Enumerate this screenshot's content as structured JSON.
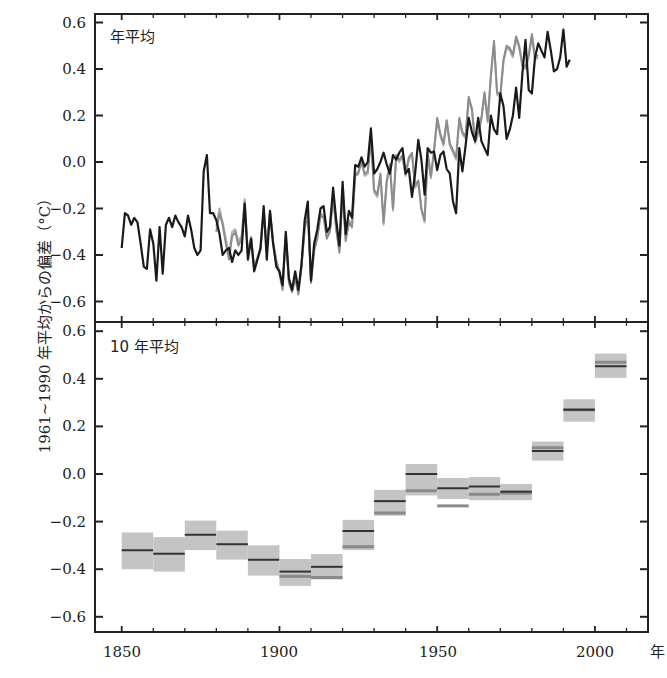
{
  "chart_data": [
    {
      "type": "line",
      "panel": "top",
      "title": "年平均",
      "xlabel": "年",
      "ylabel": "1961~1990 年平均からの偏差（°C）",
      "xlim": [
        1841.5,
        2018.5
      ],
      "ylim": [
        -0.65,
        0.64
      ],
      "x_ticks": [
        1850,
        1900,
        1950,
        2000
      ],
      "y_ticks": [
        -0.6,
        -0.4,
        -0.2,
        0.0,
        0.2,
        0.4,
        0.6
      ],
      "y_tick_labels": [
        "−0.6",
        "−0.4",
        "−0.2",
        "0.0",
        "0.2",
        "0.4",
        "0.6"
      ],
      "grid": false,
      "legend": null,
      "series": [
        {
          "name": "dataset-1 (black)",
          "color": "#1a1a1a",
          "start_year": 1850,
          "values": [
            -0.37,
            -0.22,
            -0.23,
            -0.27,
            -0.24,
            -0.26,
            -0.35,
            -0.45,
            -0.46,
            -0.29,
            -0.35,
            -0.51,
            -0.28,
            -0.48,
            -0.27,
            -0.24,
            -0.28,
            -0.23,
            -0.26,
            -0.28,
            -0.32,
            -0.23,
            -0.29,
            -0.37,
            -0.4,
            -0.38,
            -0.04,
            0.03,
            -0.22,
            -0.22,
            -0.25,
            -0.31,
            -0.4,
            -0.38,
            -0.37,
            -0.43,
            -0.38,
            -0.4,
            -0.38,
            -0.18,
            -0.42,
            -0.33,
            -0.47,
            -0.42,
            -0.37,
            -0.19,
            -0.42,
            -0.21,
            -0.35,
            -0.45,
            -0.47,
            -0.53,
            -0.3,
            -0.5,
            -0.55,
            -0.47,
            -0.55,
            -0.44,
            -0.25,
            -0.17,
            -0.51,
            -0.35,
            -0.29,
            -0.2,
            -0.19,
            -0.3,
            -0.28,
            -0.11,
            -0.25,
            -0.36,
            -0.085,
            -0.31,
            -0.21,
            -0.24,
            -0.013,
            -0.02,
            0.02,
            -0.02,
            0.0,
            0.145,
            -0.05,
            -0.03,
            0.0,
            0.04,
            -0.01,
            -0.05,
            0.03,
            0.01,
            0.04,
            0.06,
            -0.05,
            -0.03,
            -0.15,
            -0.05,
            0.095,
            0.01,
            -0.14,
            0.06,
            0.04,
            0.045,
            -0.035,
            0.03,
            0.045,
            -0.03,
            -0.05,
            -0.17,
            -0.22,
            0.06,
            -0.04,
            0.07,
            0.19,
            0.13,
            0.09,
            0.19,
            0.09,
            0.06,
            0.03,
            0.2,
            0.14,
            0.12,
            0.295,
            0.24,
            0.1,
            0.14,
            0.2,
            0.32,
            0.19,
            0.38,
            0.525,
            0.31,
            0.295,
            0.45,
            0.51,
            0.48,
            0.45,
            0.56,
            0.48,
            0.39,
            0.4,
            0.45,
            0.57,
            0.41,
            0.44
          ],
          "end_year": 2012
        },
        {
          "name": "dataset-2 (gray)",
          "color": "#8c8c8c",
          "start_year": 1880,
          "values": [
            -0.3,
            -0.22,
            -0.27,
            -0.35,
            -0.42,
            -0.32,
            -0.3,
            -0.36,
            -0.33,
            -0.17,
            -0.4,
            -0.33,
            -0.46,
            -0.42,
            -0.38,
            -0.21,
            -0.38,
            -0.22,
            -0.35,
            -0.43,
            -0.48,
            -0.55,
            -0.32,
            -0.52,
            -0.56,
            -0.5,
            -0.57,
            -0.45,
            -0.29,
            -0.22,
            -0.52,
            -0.38,
            -0.33,
            -0.23,
            -0.24,
            -0.33,
            -0.3,
            -0.15,
            -0.29,
            -0.39,
            -0.13,
            -0.34,
            -0.26,
            -0.28,
            -0.06,
            -0.05,
            0.0,
            -0.05,
            -0.04,
            0.11,
            -0.12,
            -0.14,
            -0.05,
            -0.26,
            -0.08,
            -0.01,
            -0.2,
            0.03,
            0.01,
            0.03,
            -0.05,
            0.02,
            0.04,
            -0.1,
            -0.08,
            -0.2,
            -0.25,
            0.04,
            -0.06,
            0.05,
            0.19,
            0.12,
            0.08,
            0.18,
            0.08,
            0.05,
            0.02,
            0.19,
            0.13,
            0.11,
            0.28,
            0.23,
            0.09,
            0.13,
            0.19,
            0.3,
            0.18,
            0.37,
            0.52,
            0.3,
            0.29,
            0.44,
            0.5,
            0.49,
            0.46,
            0.54,
            0.5,
            0.42,
            0.41,
            0.46,
            0.55,
            0.45,
            0.46
          ],
          "end_year": 2012
        },
        {
          "name": "dataset-3 (light gray)",
          "color": "#b0b0b0",
          "start_year": 1880,
          "values": [
            -0.28,
            -0.2,
            -0.26,
            -0.33,
            -0.4,
            -0.3,
            -0.29,
            -0.34,
            -0.32,
            -0.16,
            -0.39,
            -0.32,
            -0.45,
            -0.41,
            -0.37,
            -0.2,
            -0.37,
            -0.21,
            -0.34,
            -0.42,
            -0.47,
            -0.54,
            -0.31,
            -0.51,
            -0.55,
            -0.49,
            -0.56,
            -0.44,
            -0.28,
            -0.21,
            -0.5,
            -0.37,
            -0.32,
            -0.22,
            -0.23,
            -0.32,
            -0.29,
            -0.14,
            -0.28,
            -0.38,
            -0.12,
            -0.33,
            -0.25,
            -0.27,
            -0.05,
            -0.04,
            0.01,
            -0.06,
            -0.05,
            0.1,
            -0.13,
            -0.15,
            -0.06,
            -0.27,
            -0.09,
            -0.02,
            -0.21,
            0.02,
            0.0,
            0.02,
            -0.06,
            0.01,
            0.03,
            -0.11,
            -0.09,
            -0.21,
            -0.26,
            0.03,
            -0.07,
            0.04,
            0.18,
            0.11,
            0.07,
            0.17,
            0.07,
            0.04,
            0.01,
            0.18,
            0.12,
            0.1,
            0.27,
            0.22,
            0.08,
            0.12,
            0.18,
            0.29,
            0.17,
            0.36,
            0.51,
            0.29,
            0.28,
            0.43,
            0.49,
            0.48,
            0.45,
            0.53,
            0.49,
            0.41,
            0.4,
            0.45,
            0.54,
            0.44,
            0.45
          ],
          "end_year": 2012
        }
      ]
    },
    {
      "type": "bar",
      "subtype": "decadal-range-boxes",
      "panel": "bottom",
      "title": "10 年平均",
      "xlabel": "年",
      "ylabel": "1961~1990 年平均からの偏差（°C）",
      "xlim": [
        1841.5,
        2018.5
      ],
      "ylim": [
        -0.67,
        0.64
      ],
      "x_ticks": [
        1850,
        1900,
        1950,
        2000
      ],
      "x_tick_labels": [
        "1850",
        "1900",
        "1950",
        "2000"
      ],
      "y_ticks": [
        -0.6,
        -0.4,
        -0.2,
        0.0,
        0.2,
        0.4,
        0.6
      ],
      "y_tick_labels": [
        "−0.6",
        "−0.4",
        "−0.2",
        "0.0",
        "0.2",
        "0.4",
        "0.6"
      ],
      "grid": false,
      "categories": [
        "1850s",
        "1860s",
        "1870s",
        "1880s",
        "1890s",
        "1900s",
        "1910s",
        "1920s",
        "1930s",
        "1940s",
        "1950s",
        "1960s",
        "1970s",
        "1980s",
        "1990s",
        "2000s"
      ],
      "decade_start": [
        1850,
        1860,
        1870,
        1880,
        1890,
        1900,
        1910,
        1920,
        1930,
        1940,
        1950,
        1960,
        1970,
        1980,
        1990,
        2000
      ],
      "values": [
        -0.32,
        -0.335,
        -0.255,
        -0.295,
        -0.36,
        -0.41,
        -0.39,
        -0.24,
        -0.114,
        0.0,
        -0.06,
        -0.053,
        -0.074,
        0.097,
        0.27,
        0.453
      ],
      "range_low": [
        -0.4,
        -0.41,
        -0.32,
        -0.36,
        -0.427,
        -0.47,
        -0.443,
        -0.32,
        -0.176,
        -0.09,
        -0.105,
        -0.11,
        -0.11,
        0.056,
        0.22,
        0.404
      ],
      "range_high": [
        -0.246,
        -0.265,
        -0.196,
        -0.238,
        -0.3,
        -0.357,
        -0.336,
        -0.193,
        -0.067,
        0.042,
        -0.017,
        -0.013,
        -0.042,
        0.136,
        0.314,
        0.506
      ],
      "other_dataset_means": [
        null,
        null,
        null,
        null,
        null,
        -0.43,
        -0.435,
        -0.306,
        -0.164,
        -0.07,
        -0.134,
        -0.085,
        -0.08,
        0.11,
        0.27,
        0.47
      ]
    }
  ],
  "labels": {
    "top_panel_title": "年平均",
    "bottom_panel_title": "10 年平均",
    "y_axis_title": "1961~1990 年平均からの偏差（°C）",
    "x_axis_unit": "年",
    "x_tick_labels": [
      "1850",
      "1900",
      "1950",
      "2000"
    ]
  }
}
